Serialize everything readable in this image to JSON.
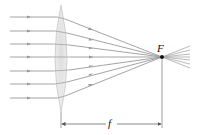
{
  "diagram": {
    "title": "",
    "focal_point_label": "F",
    "focal_length_label": "f",
    "colors": {
      "ray": "#9a9a9a",
      "lens_fill": "#e6e6e6",
      "lens_edge": "#c8c8c8",
      "focal_point": "#111111",
      "dimension_line": "#555555"
    },
    "lens": {
      "x": 61,
      "top": 5,
      "bottom": 112,
      "half_width": 10
    },
    "rays_y": [
      17,
      31,
      44,
      57,
      71,
      84,
      98
    ],
    "focal_point": {
      "x": 162,
      "y": 57
    },
    "dimension": {
      "y": 124,
      "x_start": 61,
      "x_end": 162
    }
  }
}
